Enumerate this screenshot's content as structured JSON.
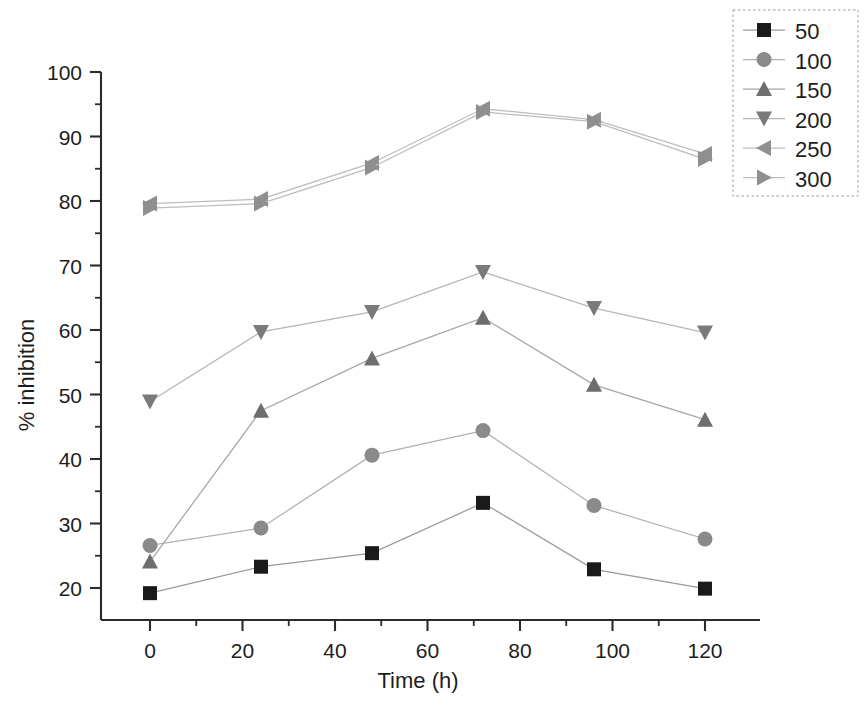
{
  "chart_data": {
    "type": "line",
    "title": "",
    "xlabel": "Time (h)",
    "ylabel": "% inhibition",
    "x": [
      0,
      24,
      48,
      72,
      96,
      120
    ],
    "xlim": [
      -8,
      128
    ],
    "ylim": [
      16.5,
      102
    ],
    "xticks": [
      0,
      20,
      40,
      60,
      80,
      100,
      120
    ],
    "xtick_labels": [
      "0",
      "20",
      "40",
      "60",
      "80",
      "100",
      "120"
    ],
    "yticks": [
      20,
      30,
      40,
      50,
      60,
      70,
      80,
      90,
      100
    ],
    "ytick_labels": [
      "20",
      "30",
      "40",
      "50",
      "60",
      "70",
      "80",
      "90",
      "100"
    ],
    "x_minor_step": 10,
    "y_minor_step": 5,
    "grid": false,
    "legend_position": "top-right",
    "series": [
      {
        "name": "50",
        "marker": "square",
        "color": "#1a1a1a",
        "line_color": "#9a9a9a",
        "values": [
          19.2,
          23.3,
          25.4,
          33.2,
          22.9,
          19.9
        ]
      },
      {
        "name": "100",
        "marker": "circle",
        "color": "#8a8a8a",
        "line_color": "#b0b0b0",
        "values": [
          26.6,
          29.3,
          40.6,
          44.4,
          32.8,
          27.6
        ]
      },
      {
        "name": "150",
        "marker": "triangle-up",
        "color": "#6e6e6e",
        "line_color": "#a6a6a6",
        "values": [
          24.1,
          47.5,
          55.6,
          61.9,
          51.5,
          46.1
        ]
      },
      {
        "name": "200",
        "marker": "triangle-down",
        "color": "#7a7a7a",
        "line_color": "#b5b5b5",
        "values": [
          48.9,
          59.7,
          62.8,
          69.0,
          63.4,
          59.6
        ]
      },
      {
        "name": "250",
        "marker": "triangle-left",
        "color": "#8f8f8f",
        "line_color": "#bcbcbc",
        "values": [
          79.6,
          80.3,
          85.9,
          94.3,
          92.6,
          87.3
        ]
      },
      {
        "name": "300",
        "marker": "triangle-right",
        "color": "#8f8f8f",
        "line_color": "#bcbcbc",
        "values": [
          78.9,
          79.6,
          85.2,
          93.8,
          92.3,
          86.5
        ]
      }
    ],
    "legend_entries": [
      "50",
      "100",
      "150",
      "200",
      "250",
      "300"
    ]
  },
  "axes": {
    "x_title": "Time (h)",
    "y_title": "% inhibition"
  }
}
